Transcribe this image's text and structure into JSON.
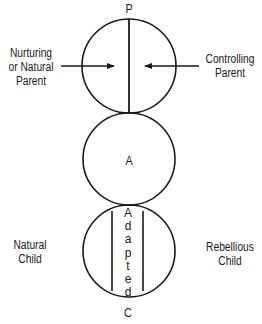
{
  "diagram": {
    "type": "transactional-analysis-ego-states",
    "colors": {
      "stroke": "#1a1a1a",
      "background": "#ffffff"
    },
    "parent": {
      "letter": "P",
      "left_label": [
        "Nurturing",
        "or Natural",
        "Parent"
      ],
      "right_label": [
        "Controlling",
        "Parent"
      ]
    },
    "adult": {
      "letter": "A"
    },
    "child": {
      "letter": "C",
      "left_label": [
        "Natural",
        "Child"
      ],
      "right_label": [
        "Rebellious",
        "Child"
      ],
      "center_label_letters": [
        "A",
        "d",
        "a",
        "p",
        "t",
        "e",
        "d"
      ]
    }
  }
}
